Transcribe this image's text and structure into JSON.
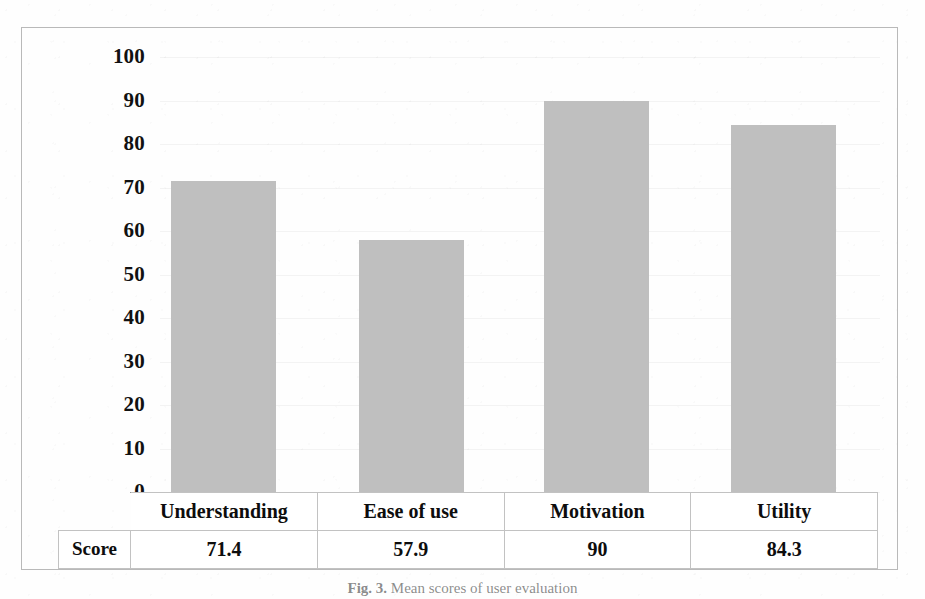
{
  "figure": {
    "caption_label": "Fig. 3.",
    "caption_text": "Mean scores of user evaluation"
  },
  "table": {
    "row_label": "Score",
    "headers": [
      "Understanding",
      "Ease of use",
      "Motivation",
      "Utility"
    ],
    "values": [
      "71.4",
      "57.9",
      "90",
      "84.3"
    ]
  },
  "axis": {
    "ticks": [
      "100",
      "90",
      "80",
      "70",
      "60",
      "50",
      "40",
      "30",
      "20",
      "10",
      "0"
    ]
  },
  "colors": {
    "bar_fill": "#bfbfbf",
    "frame": "#b9b9b9",
    "table_border": "#c2c2c2",
    "text": "#000000"
  },
  "chart_data": {
    "type": "bar",
    "title": "",
    "xlabel": "",
    "ylabel": "",
    "categories": [
      "Understanding",
      "Ease of use",
      "Motivation",
      "Utility"
    ],
    "values": [
      71.4,
      57.9,
      90,
      84.3
    ],
    "ylim": [
      0,
      100
    ],
    "yticks": [
      0,
      10,
      20,
      30,
      40,
      50,
      60,
      70,
      80,
      90,
      100
    ],
    "grid": true,
    "legend": false,
    "series": [
      {
        "name": "Score",
        "values": [
          71.4,
          57.9,
          90,
          84.3
        ]
      }
    ]
  }
}
